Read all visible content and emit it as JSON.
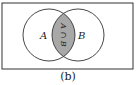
{
  "figure": {
    "caption": "(b)",
    "universe_rect": {
      "x": 2,
      "y": 3,
      "width": 131,
      "height": 66
    },
    "set_a": {
      "label": "A",
      "cx": 49,
      "cy": 35,
      "r": 26
    },
    "set_b": {
      "label": "B",
      "cx": 78,
      "cy": 35,
      "r": 26
    },
    "intersection": {
      "label": "A ∩ B",
      "fill": "#a8a8a8"
    },
    "colors": {
      "stroke": "#333333",
      "background": "#ffffff",
      "text": "#222222"
    }
  }
}
